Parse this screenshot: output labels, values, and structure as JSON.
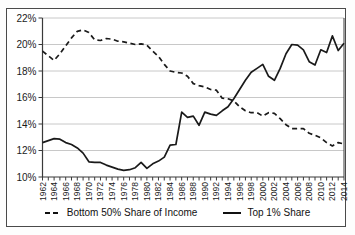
{
  "chart_data": {
    "type": "line",
    "x": [
      1962,
      1963,
      1964,
      1965,
      1966,
      1967,
      1968,
      1969,
      1970,
      1971,
      1972,
      1973,
      1974,
      1975,
      1976,
      1977,
      1978,
      1979,
      1980,
      1981,
      1982,
      1983,
      1984,
      1985,
      1986,
      1987,
      1988,
      1989,
      1990,
      1991,
      1992,
      1993,
      1994,
      1995,
      1996,
      1997,
      1998,
      1999,
      2000,
      2001,
      2002,
      2003,
      2004,
      2005,
      2006,
      2007,
      2008,
      2009,
      2010,
      2011,
      2012,
      2013,
      2014
    ],
    "series": [
      {
        "name": "Bottom 50% Share of Income",
        "style": "dashed",
        "values": [
          19.5,
          19.15,
          18.8,
          19.3,
          19.9,
          20.5,
          21.0,
          21.1,
          20.9,
          20.35,
          20.3,
          20.45,
          20.4,
          20.25,
          20.2,
          20.1,
          20.0,
          20.05,
          19.95,
          19.5,
          19.1,
          18.5,
          18.0,
          17.9,
          17.85,
          17.6,
          17.05,
          16.9,
          16.8,
          16.6,
          16.55,
          15.95,
          15.9,
          15.75,
          15.3,
          15.0,
          14.85,
          14.85,
          14.6,
          14.85,
          14.8,
          14.4,
          13.95,
          13.65,
          13.65,
          13.65,
          13.3,
          13.15,
          12.95,
          12.6,
          12.35,
          12.6,
          12.5
        ]
      },
      {
        "name": "Top 1% Share",
        "style": "solid",
        "values": [
          12.6,
          12.75,
          12.9,
          12.85,
          12.6,
          12.45,
          12.2,
          11.8,
          11.15,
          11.1,
          11.1,
          10.9,
          10.75,
          10.6,
          10.5,
          10.55,
          10.7,
          11.1,
          10.65,
          11.0,
          11.2,
          11.5,
          12.4,
          12.45,
          14.9,
          14.5,
          14.6,
          13.9,
          14.9,
          14.75,
          14.65,
          15.0,
          15.3,
          15.9,
          16.6,
          17.3,
          17.9,
          18.2,
          18.5,
          17.6,
          17.3,
          18.2,
          19.3,
          20.0,
          19.95,
          19.6,
          18.7,
          18.45,
          19.6,
          19.4,
          20.65,
          19.55,
          20.1
        ]
      }
    ],
    "title": "",
    "xlabel": "",
    "ylabel": "",
    "ylim": [
      10,
      22
    ],
    "ytick_labels": [
      "10%",
      "12%",
      "14%",
      "16%",
      "18%",
      "20%",
      "22%"
    ],
    "ytick_values": [
      10,
      12,
      14,
      16,
      18,
      20,
      22
    ],
    "xtick_labels": [
      "1962",
      "1964",
      "1966",
      "1968",
      "1970",
      "1972",
      "1974",
      "1976",
      "1978",
      "1980",
      "1982",
      "1984",
      "1986",
      "1988",
      "1990",
      "1992",
      "1994",
      "1996",
      "1998",
      "2000",
      "2002",
      "2004",
      "2006",
      "2008",
      "2010",
      "2012",
      "2014"
    ],
    "xtick_values": [
      1962,
      1964,
      1966,
      1968,
      1970,
      1972,
      1974,
      1976,
      1978,
      1980,
      1982,
      1984,
      1986,
      1988,
      1990,
      1992,
      1994,
      1996,
      1998,
      2000,
      2002,
      2004,
      2006,
      2008,
      2010,
      2012,
      2014
    ],
    "grid": true,
    "legend_position": "bottom",
    "colors": {
      "line": "#1a1a1a",
      "grid": "#c8c8c8",
      "axis": "#3a3a3a",
      "text": "#1a1a1a",
      "frame": "#4a4a4a",
      "background": "#ffffff"
    }
  },
  "legend": {
    "items": [
      {
        "label": "Bottom 50% Share of Income",
        "style": "dashed"
      },
      {
        "label": "Top 1% Share",
        "style": "solid"
      }
    ]
  }
}
